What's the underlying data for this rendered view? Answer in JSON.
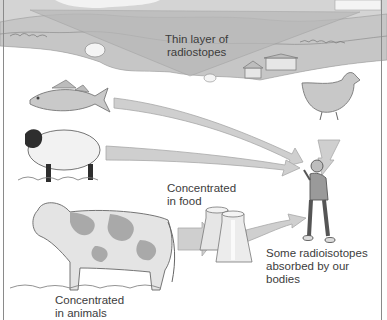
{
  "diagram": {
    "labels": {
      "thin_layer": [
        "Thin layer of",
        "radiostopes"
      ],
      "concentrated_food": [
        "Concentrated",
        "in food"
      ],
      "concentrated_animals": [
        "Concentrated",
        "in animals"
      ],
      "absorbed": [
        "Some radioisotopes",
        "absorbed by our",
        "bodies"
      ]
    },
    "elements": {
      "landscape": "landscape-with-farm",
      "sources": [
        "fish",
        "sheep",
        "cow",
        "chicken"
      ],
      "food": "milk-churns",
      "target": "human"
    },
    "colors": {
      "arrow_fill": "#cfcfcf",
      "arrow_stroke": "#a8a8a8",
      "landscape": "#c8c8c8",
      "wedge": "#b9b9b9",
      "frame": "#8a8a8a",
      "text": "#3c3c3c"
    }
  }
}
